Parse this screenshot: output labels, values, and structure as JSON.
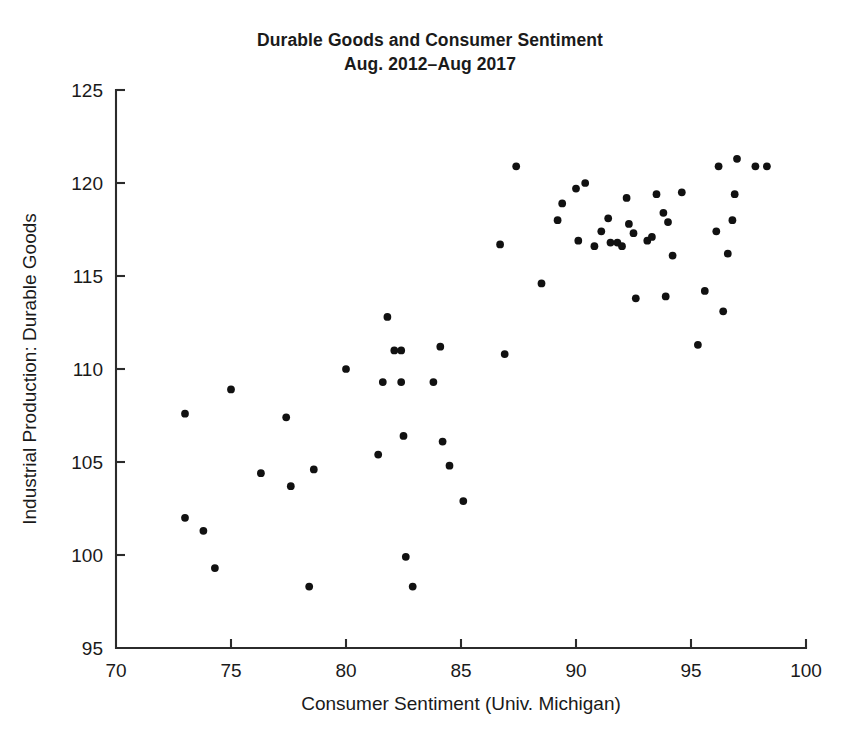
{
  "chart_data": {
    "type": "scatter",
    "title": "Durable Goods and Consumer Sentiment",
    "subtitle": "Aug. 2012–Aug 2017",
    "xlabel": "Consumer Sentiment (Univ. Michigan)",
    "ylabel": "Industrial Production: Durable Goods",
    "xlim": [
      70,
      100
    ],
    "ylim": [
      95,
      125
    ],
    "xticks": [
      70,
      75,
      80,
      85,
      90,
      95,
      100
    ],
    "yticks": [
      95,
      100,
      105,
      110,
      115,
      120,
      125
    ],
    "xtick_labels": [
      "70",
      "75",
      "80",
      "85",
      "90",
      "95",
      "100"
    ],
    "ytick_labels": [
      "95",
      "100",
      "105",
      "110",
      "115",
      "120",
      "125"
    ],
    "grid": false,
    "legend": null,
    "marker": "filled-circle",
    "marker_color": "#111111",
    "marker_size": 6,
    "series": [
      {
        "name": "Monthly observations",
        "points": [
          [
            73.0,
            102.0
          ],
          [
            73.0,
            107.6
          ],
          [
            73.8,
            101.3
          ],
          [
            74.3,
            99.3
          ],
          [
            75.0,
            108.9
          ],
          [
            76.3,
            104.4
          ],
          [
            77.4,
            107.4
          ],
          [
            77.6,
            103.7
          ],
          [
            78.4,
            98.3
          ],
          [
            78.6,
            104.6
          ],
          [
            80.0,
            110.0
          ],
          [
            81.4,
            105.4
          ],
          [
            81.6,
            109.3
          ],
          [
            81.8,
            112.8
          ],
          [
            82.1,
            111.0
          ],
          [
            82.4,
            111.0
          ],
          [
            82.4,
            109.3
          ],
          [
            82.5,
            106.4
          ],
          [
            82.6,
            99.9
          ],
          [
            82.9,
            98.3
          ],
          [
            83.8,
            109.3
          ],
          [
            84.1,
            111.2
          ],
          [
            84.2,
            106.1
          ],
          [
            84.5,
            104.8
          ],
          [
            85.1,
            102.9
          ],
          [
            86.7,
            116.7
          ],
          [
            86.9,
            110.8
          ],
          [
            87.4,
            120.9
          ],
          [
            88.5,
            114.6
          ],
          [
            89.2,
            118.0
          ],
          [
            89.4,
            118.9
          ],
          [
            90.0,
            119.7
          ],
          [
            90.1,
            116.9
          ],
          [
            90.4,
            120.0
          ],
          [
            90.8,
            116.6
          ],
          [
            91.1,
            117.4
          ],
          [
            91.4,
            118.1
          ],
          [
            91.5,
            116.8
          ],
          [
            91.8,
            116.8
          ],
          [
            92.0,
            116.6
          ],
          [
            92.2,
            119.2
          ],
          [
            92.3,
            117.8
          ],
          [
            92.5,
            117.3
          ],
          [
            92.6,
            113.8
          ],
          [
            93.1,
            116.9
          ],
          [
            93.3,
            117.1
          ],
          [
            93.5,
            119.4
          ],
          [
            93.8,
            118.4
          ],
          [
            93.9,
            113.9
          ],
          [
            94.0,
            117.9
          ],
          [
            94.2,
            116.1
          ],
          [
            94.6,
            119.5
          ],
          [
            95.3,
            111.3
          ],
          [
            95.6,
            114.2
          ],
          [
            96.1,
            117.4
          ],
          [
            96.2,
            120.9
          ],
          [
            96.4,
            113.1
          ],
          [
            96.6,
            116.2
          ],
          [
            96.8,
            118.0
          ],
          [
            96.9,
            119.4
          ],
          [
            97.0,
            121.3
          ],
          [
            97.8,
            120.9
          ],
          [
            98.3,
            120.9
          ]
        ]
      }
    ]
  },
  "figure": {
    "background_color": "#ffffff",
    "axis_color": "#2b2b2b",
    "text_color": "#1a1a1a"
  }
}
